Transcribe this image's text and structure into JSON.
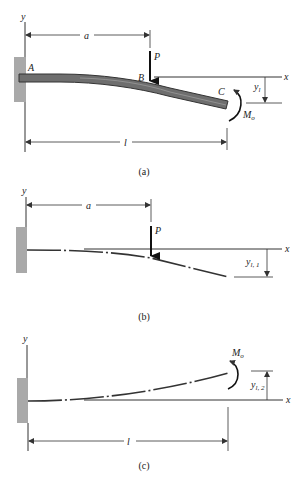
{
  "figure": {
    "panels": [
      {
        "id": "a",
        "caption": "(a)",
        "labels": {
          "y_axis": "y",
          "x_axis": "x",
          "point_a": "A",
          "point_b": "B",
          "point_c": "C",
          "load": "P",
          "moment": "M",
          "moment_sub": "o",
          "dim_a": "a",
          "dim_l": "l",
          "deflection": "y",
          "deflection_sub": "l"
        }
      },
      {
        "id": "b",
        "caption": "(b)",
        "labels": {
          "y_axis": "y",
          "x_axis": "x",
          "load": "P",
          "dim_a": "a",
          "deflection": "y",
          "deflection_sub": "l, 1"
        }
      },
      {
        "id": "c",
        "caption": "(c)",
        "labels": {
          "y_axis": "y",
          "x_axis": "x",
          "moment": "M",
          "moment_sub": "o",
          "dim_l": "l",
          "deflection": "y",
          "deflection_sub": "l, 2"
        }
      }
    ],
    "colors": {
      "wall": "#a9a9a9",
      "beam_fill": "#6e6e6e",
      "beam_edge": "#333333",
      "line": "#333333"
    }
  }
}
